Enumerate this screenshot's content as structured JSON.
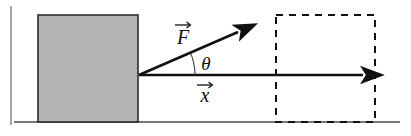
{
  "figure": {
    "width": 411,
    "height": 136,
    "background": "#ffffff"
  },
  "ground": {
    "name": "ground-line",
    "x1": 14,
    "y1": 122,
    "x2": 400,
    "y2": 122,
    "color": "#4a4a4a",
    "width": 1.6
  },
  "frame": {
    "left_edge": {
      "x": 11,
      "y1": 6,
      "y2": 125,
      "color": "#6f6f6f"
    }
  },
  "block": {
    "name": "gray-block",
    "x": 38,
    "y": 15,
    "width": 100,
    "height": 107,
    "fill": "#b4b4b4",
    "stroke": "#2b2b2b",
    "stroke_width": 1.6,
    "pattern": "halftone-dither"
  },
  "dashed_box": {
    "name": "dashed-final-position-box",
    "x": 276,
    "y": 15,
    "width": 99,
    "height": 107,
    "stroke": "#111111",
    "stroke_width": 2.0,
    "dash": "7,6"
  },
  "vectors": [
    {
      "id": "force",
      "name": "force-vector-F",
      "label": "F",
      "accent": "arrow-overbar",
      "origin": {
        "x": 139,
        "y": 75
      },
      "tip": {
        "x": 249,
        "y": 27
      },
      "color": "#101010",
      "stroke_width": 2.6,
      "label_position": {
        "x": 183,
        "y": 44
      },
      "label_font_size": 20
    },
    {
      "id": "displacement",
      "name": "displacement-vector-x",
      "label": "x",
      "accent": "arrow-overbar",
      "origin": {
        "x": 139,
        "y": 75
      },
      "tip": {
        "x": 376,
        "y": 75
      },
      "color": "#101010",
      "stroke_width": 2.6,
      "label_position": {
        "x": 205,
        "y": 102
      },
      "label_font_size": 20
    }
  ],
  "angle": {
    "name": "angle-theta",
    "label": "θ",
    "vertex": {
      "x": 139,
      "y": 75
    },
    "radius": 56,
    "start_deg": 0,
    "end_deg": 23.6,
    "value_deg": 23.6,
    "label_position": {
      "x": 206,
      "y": 70
    },
    "label_font_size": 19,
    "arc_color": "#3a3a3a",
    "arc_width": 1.1
  },
  "colors": {
    "ink": "#101010",
    "block_fill": "#b4b4b4",
    "block_stroke": "#2b2b2b",
    "ground": "#4a4a4a",
    "background": "#ffffff"
  }
}
